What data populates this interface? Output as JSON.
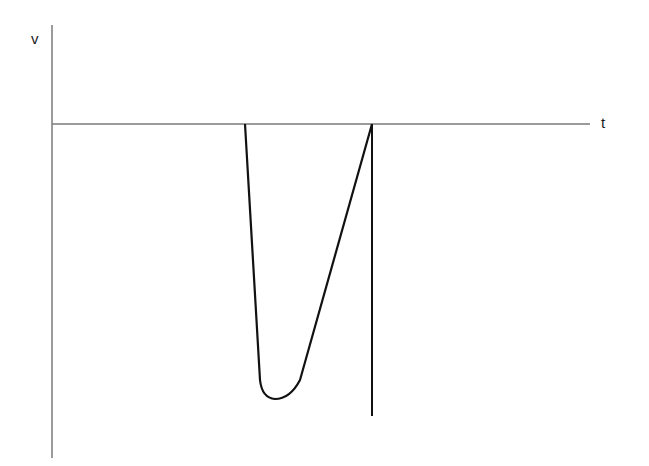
{
  "diagram": {
    "type": "velocity-time sketch",
    "axes": {
      "y_label": "v",
      "x_label": "t",
      "axis_color": "#7a7a7a"
    },
    "curve": {
      "color": "#111111",
      "description": "velocity drops steeply to a large negative minimum, then rises linearly back to zero, followed by a vertical line"
    }
  }
}
